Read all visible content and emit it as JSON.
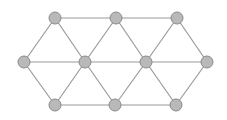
{
  "diagram": {
    "type": "triangular-lattice-graph",
    "colors": {
      "background": "#ffffff",
      "node_fill": "#b9b9b9",
      "node_stroke": "#8a8a8a",
      "edge": "#9a9a9a"
    },
    "node_radius": 6,
    "nodes": [
      {
        "id": "T1",
        "x": 55,
        "y": 18
      },
      {
        "id": "T2",
        "x": 116,
        "y": 18
      },
      {
        "id": "T3",
        "x": 177,
        "y": 18
      },
      {
        "id": "M1",
        "x": 24,
        "y": 62
      },
      {
        "id": "M2",
        "x": 85,
        "y": 62
      },
      {
        "id": "M3",
        "x": 146,
        "y": 62
      },
      {
        "id": "M4",
        "x": 207,
        "y": 62
      },
      {
        "id": "B1",
        "x": 55,
        "y": 105
      },
      {
        "id": "B2",
        "x": 115,
        "y": 105
      },
      {
        "id": "B3",
        "x": 176,
        "y": 105
      }
    ],
    "edges": [
      [
        "T1",
        "T2"
      ],
      [
        "T2",
        "T3"
      ],
      [
        "M1",
        "M2"
      ],
      [
        "M2",
        "M3"
      ],
      [
        "M3",
        "M4"
      ],
      [
        "B1",
        "B2"
      ],
      [
        "B2",
        "B3"
      ],
      [
        "T1",
        "M1"
      ],
      [
        "T1",
        "M2"
      ],
      [
        "T2",
        "M2"
      ],
      [
        "T2",
        "M3"
      ],
      [
        "T3",
        "M3"
      ],
      [
        "T3",
        "M4"
      ],
      [
        "B1",
        "M1"
      ],
      [
        "B1",
        "M2"
      ],
      [
        "B2",
        "M2"
      ],
      [
        "B2",
        "M3"
      ],
      [
        "B3",
        "M3"
      ],
      [
        "B3",
        "M4"
      ]
    ]
  }
}
